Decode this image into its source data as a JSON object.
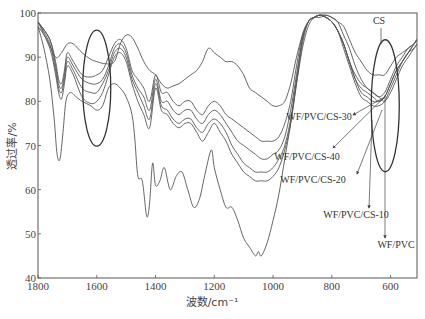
{
  "chart_data": {
    "type": "line",
    "title": "",
    "xlabel": "波数/cm⁻¹",
    "ylabel": "透过率/%",
    "xlim": [
      1800,
      510
    ],
    "ylim": [
      40,
      100
    ],
    "x_reversed": true,
    "grid": false,
    "legend": "annotations with arrows on right side",
    "x_ticks": [
      1800,
      1600,
      1400,
      1200,
      1000,
      800,
      600
    ],
    "y_ticks": [
      40,
      50,
      60,
      70,
      80,
      90,
      100
    ],
    "series": [
      {
        "name": "CS",
        "x": [
          1800,
          1770,
          1740,
          1720,
          1700,
          1680,
          1650,
          1620,
          1600,
          1570,
          1540,
          1520,
          1500,
          1480,
          1460,
          1440,
          1420,
          1400,
          1380,
          1360,
          1340,
          1320,
          1300,
          1280,
          1260,
          1240,
          1220,
          1200,
          1180,
          1160,
          1140,
          1120,
          1100,
          1080,
          1060,
          1040,
          1020,
          1000,
          980,
          960,
          940,
          920,
          900,
          880,
          860,
          840,
          820,
          800,
          780,
          760,
          740,
          720,
          700,
          680,
          660,
          640,
          620,
          600,
          580,
          560,
          540,
          520,
          510
        ],
        "values": [
          97,
          94,
          90,
          91,
          93,
          93,
          91,
          89.5,
          89,
          88.5,
          89,
          93,
          95,
          94.5,
          92,
          89,
          87,
          86,
          84,
          83,
          83.5,
          84,
          85,
          86,
          87,
          89,
          92,
          91,
          90,
          89,
          89,
          88,
          86,
          83,
          82,
          81,
          80,
          79,
          79,
          80,
          84,
          90,
          95,
          98,
          99,
          99,
          99.5,
          99,
          98,
          97,
          94,
          91,
          89,
          87,
          86,
          86,
          86,
          88,
          90,
          91,
          92,
          93,
          94
        ]
      },
      {
        "name": "WF/PVC/CS-30",
        "x": [
          1800,
          1760,
          1740,
          1730,
          1720,
          1710,
          1700,
          1680,
          1650,
          1620,
          1600,
          1580,
          1560,
          1540,
          1520,
          1500,
          1480,
          1460,
          1440,
          1420,
          1400,
          1380,
          1360,
          1340,
          1320,
          1300,
          1280,
          1260,
          1240,
          1220,
          1200,
          1180,
          1160,
          1140,
          1120,
          1100,
          1080,
          1060,
          1040,
          1020,
          1000,
          980,
          960,
          940,
          920,
          900,
          880,
          860,
          840,
          820,
          800,
          780,
          760,
          740,
          720,
          700,
          680,
          660,
          640,
          620,
          600,
          580,
          560,
          540,
          520,
          510
        ],
        "values": [
          98,
          94,
          89,
          85,
          84,
          87,
          91,
          89,
          86,
          85.5,
          86,
          87,
          90,
          93,
          94,
          92,
          87,
          85,
          83,
          80,
          86,
          82,
          82,
          80,
          79,
          80,
          80,
          78,
          77,
          79,
          80,
          79,
          77,
          76,
          75,
          74,
          73,
          72,
          71,
          71,
          71,
          72,
          75,
          80,
          88,
          95,
          98,
          99,
          99.5,
          99,
          98,
          96,
          93,
          89,
          86,
          84,
          83,
          82,
          81,
          82,
          85,
          88,
          90,
          92,
          93,
          94
        ]
      },
      {
        "name": "WF/PVC/CS-40",
        "x": [
          1800,
          1760,
          1740,
          1730,
          1720,
          1710,
          1700,
          1680,
          1650,
          1620,
          1600,
          1580,
          1560,
          1540,
          1520,
          1500,
          1480,
          1460,
          1440,
          1420,
          1400,
          1380,
          1360,
          1340,
          1320,
          1300,
          1280,
          1260,
          1240,
          1220,
          1200,
          1180,
          1160,
          1140,
          1120,
          1100,
          1080,
          1060,
          1040,
          1020,
          1000,
          980,
          960,
          940,
          920,
          900,
          880,
          860,
          840,
          820,
          800,
          780,
          760,
          740,
          720,
          700,
          680,
          660,
          640,
          620,
          600,
          580,
          560,
          540,
          520,
          510
        ],
        "values": [
          98,
          94,
          88,
          84,
          83,
          86,
          90,
          88,
          85,
          84,
          84,
          85,
          88,
          92,
          93,
          91,
          86,
          83,
          81,
          78,
          85,
          80,
          80,
          78,
          77,
          78,
          78,
          76,
          75,
          77,
          78,
          77,
          75,
          73,
          71,
          70,
          69,
          68,
          67,
          67,
          68,
          69,
          72,
          78,
          86,
          94,
          98,
          99,
          99.5,
          99,
          98,
          96,
          93,
          89,
          85,
          83,
          82,
          81,
          80,
          81,
          84,
          87,
          89,
          91,
          93,
          94
        ]
      },
      {
        "name": "WF/PVC/CS-20",
        "x": [
          1800,
          1760,
          1740,
          1730,
          1720,
          1710,
          1700,
          1680,
          1650,
          1620,
          1600,
          1580,
          1560,
          1540,
          1520,
          1500,
          1480,
          1460,
          1440,
          1420,
          1400,
          1380,
          1360,
          1340,
          1320,
          1300,
          1280,
          1260,
          1240,
          1220,
          1200,
          1180,
          1160,
          1140,
          1120,
          1100,
          1080,
          1060,
          1040,
          1020,
          1000,
          980,
          960,
          940,
          920,
          900,
          880,
          860,
          840,
          820,
          800,
          780,
          760,
          740,
          720,
          700,
          680,
          660,
          640,
          620,
          600,
          580,
          560,
          540,
          520,
          510
        ],
        "values": [
          98,
          93,
          87,
          83,
          82,
          85,
          89,
          87,
          83,
          82,
          82,
          84,
          87,
          91,
          92,
          90,
          85,
          82,
          79,
          76,
          84,
          79,
          78,
          76,
          75,
          76,
          76,
          74,
          73,
          75,
          76,
          75,
          73,
          70,
          68,
          66,
          65,
          64,
          64,
          64,
          65,
          67,
          70,
          76,
          85,
          94,
          98,
          99,
          99.5,
          99,
          98,
          96,
          93,
          89,
          85,
          82,
          81,
          80,
          80,
          81,
          84,
          87,
          89,
          91,
          93,
          94
        ]
      },
      {
        "name": "WF/PVC/CS-10",
        "x": [
          1800,
          1760,
          1740,
          1730,
          1720,
          1710,
          1700,
          1680,
          1650,
          1620,
          1600,
          1580,
          1560,
          1540,
          1520,
          1500,
          1480,
          1460,
          1440,
          1420,
          1400,
          1380,
          1360,
          1340,
          1320,
          1300,
          1280,
          1260,
          1240,
          1220,
          1200,
          1180,
          1160,
          1140,
          1120,
          1100,
          1080,
          1060,
          1040,
          1020,
          1000,
          980,
          960,
          940,
          920,
          900,
          880,
          860,
          840,
          820,
          800,
          780,
          760,
          740,
          720,
          700,
          680,
          660,
          640,
          620,
          600,
          580,
          560,
          540,
          520,
          510
        ],
        "values": [
          98,
          92,
          86,
          82,
          80.5,
          84,
          88,
          86,
          81,
          79.5,
          80,
          82,
          86,
          90,
          91,
          89,
          84,
          80,
          77,
          74,
          83,
          78,
          77,
          75,
          74,
          75,
          75,
          73,
          71,
          73,
          75,
          73,
          71,
          68,
          66,
          64,
          63,
          62,
          62,
          62,
          63,
          65,
          69,
          75,
          84,
          93,
          98,
          99,
          99.5,
          99,
          98,
          96,
          92,
          88,
          84,
          81,
          80,
          79,
          79,
          80,
          83,
          86,
          89,
          91,
          92,
          93
        ]
      },
      {
        "name": "WF/PVC",
        "x": [
          1800,
          1780,
          1760,
          1745,
          1735,
          1725,
          1715,
          1705,
          1690,
          1670,
          1650,
          1620,
          1600,
          1580,
          1560,
          1540,
          1520,
          1500,
          1480,
          1470,
          1460,
          1445,
          1430,
          1420,
          1410,
          1400,
          1385,
          1370,
          1350,
          1330,
          1310,
          1290,
          1270,
          1250,
          1230,
          1210,
          1200,
          1180,
          1160,
          1140,
          1120,
          1100,
          1080,
          1060,
          1050,
          1040,
          1020,
          1000,
          980,
          960,
          940,
          920,
          900,
          880,
          860,
          840,
          820,
          800,
          780,
          760,
          740,
          720,
          700,
          680,
          660,
          640,
          620,
          600,
          580,
          560,
          540,
          520,
          510
        ],
        "values": [
          97,
          92,
          85,
          76,
          68,
          67,
          73,
          80,
          82,
          81,
          80,
          79,
          78,
          79,
          83,
          84,
          83,
          81,
          77,
          71,
          63,
          62,
          54,
          57,
          66,
          61,
          62,
          65,
          60,
          63,
          64,
          60,
          56,
          58,
          64,
          69,
          65,
          60,
          56,
          56,
          53,
          49,
          47,
          45,
          46,
          45,
          48,
          53,
          59,
          67,
          75,
          84,
          92,
          97,
          99,
          99.5,
          99.5,
          99,
          98,
          95,
          92,
          88,
          85,
          83,
          82,
          81,
          80,
          82,
          85,
          88,
          90,
          92,
          93
        ]
      }
    ],
    "annotations": [
      {
        "text": "CS",
        "pointing_to_x": 620,
        "pointing_to_y": 95
      },
      {
        "text": "WF/PVC/CS-30",
        "pointing_to_x": 620,
        "pointing_to_y": 81
      },
      {
        "text": "WF/PVC/CS-40",
        "pointing_to_x": 620,
        "pointing_to_y": 81
      },
      {
        "text": "WF/PVC/CS-20",
        "pointing_to_x": 620,
        "pointing_to_y": 81
      },
      {
        "text": "WF/PVC/CS-10",
        "pointing_to_x": 620,
        "pointing_to_y": 81
      },
      {
        "text": "WF/PVC",
        "pointing_to_x": 620,
        "pointing_to_y": 81
      }
    ],
    "highlight_ellipses": [
      {
        "center_x": 1600,
        "center_y": 83,
        "note": "ellipse around ~1600 cm-1 region"
      },
      {
        "center_x": 620,
        "center_y": 82,
        "note": "ellipse around ~620 cm-1 region"
      }
    ]
  }
}
